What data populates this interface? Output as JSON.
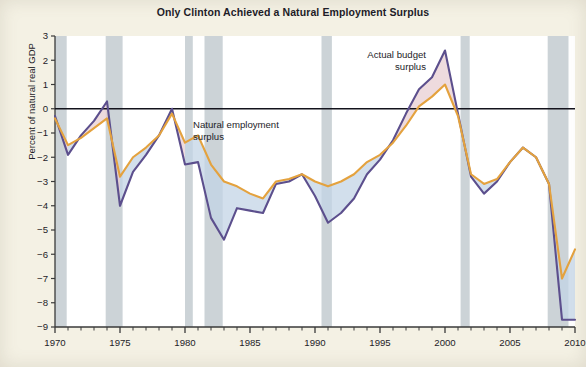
{
  "chart_data": {
    "type": "line",
    "title": "Only Clinton Achieved a Natural Employment Surplus",
    "xlabel": "",
    "ylabel": "Percent of natural real GDP",
    "xlim": [
      1970,
      2010
    ],
    "ylim": [
      -9,
      3
    ],
    "grid": false,
    "legend_position": "inline-annotations",
    "x_ticks": [
      1970,
      1975,
      1980,
      1985,
      1990,
      1995,
      2000,
      2005,
      2010
    ],
    "x_tick_labels": [
      "1970",
      "1975",
      "1980",
      "1985",
      "1990",
      "1995",
      "2000",
      "2005",
      "2010"
    ],
    "x_minor_tick_step": 1,
    "y_ticks": [
      3,
      2,
      1,
      0,
      -1,
      -2,
      -3,
      -4,
      -5,
      -6,
      -7,
      -8,
      -9
    ],
    "y_tick_labels": [
      "3",
      "2",
      "1",
      "0",
      "−1",
      "−2",
      "−3",
      "−4",
      "−5",
      "−6",
      "−7",
      "−8",
      "−9"
    ],
    "x": [
      1970,
      1971,
      1972,
      1973,
      1974,
      1975,
      1976,
      1977,
      1978,
      1979,
      1980,
      1981,
      1982,
      1983,
      1984,
      1985,
      1986,
      1987,
      1988,
      1989,
      1990,
      1991,
      1992,
      1993,
      1994,
      1995,
      1996,
      1997,
      1998,
      1999,
      2000,
      2001,
      2002,
      2003,
      2004,
      2005,
      2006,
      2007,
      2008,
      2009,
      2010
    ],
    "series": [
      {
        "name": "Actual budget surplus",
        "color": "#5c4f8d",
        "values": [
          -0.3,
          -1.9,
          -1.1,
          -0.5,
          0.3,
          -4.0,
          -2.6,
          -1.9,
          -1.1,
          0.0,
          -2.3,
          -2.2,
          -4.5,
          -5.4,
          -4.1,
          -4.2,
          -4.3,
          -3.1,
          -3.0,
          -2.7,
          -3.6,
          -4.7,
          -4.3,
          -3.7,
          -2.7,
          -2.1,
          -1.3,
          -0.2,
          0.8,
          1.3,
          2.4,
          -0.2,
          -2.8,
          -3.5,
          -3.0,
          -2.2,
          -1.6,
          -2.0,
          -3.1,
          -8.7,
          -8.7
        ]
      },
      {
        "name": "Natural employment surplus",
        "color": "#e4a23e",
        "values": [
          -0.4,
          -1.5,
          -1.2,
          -0.8,
          -0.4,
          -2.8,
          -2.0,
          -1.6,
          -1.1,
          -0.2,
          -1.4,
          -1.1,
          -2.3,
          -3.0,
          -3.2,
          -3.5,
          -3.7,
          -3.0,
          -2.9,
          -2.7,
          -3.0,
          -3.2,
          -3.0,
          -2.7,
          -2.2,
          -1.9,
          -1.4,
          -0.7,
          0.1,
          0.5,
          1.0,
          -0.3,
          -2.7,
          -3.1,
          -2.9,
          -2.2,
          -1.6,
          -2.0,
          -3.1,
          -7.0,
          -5.8
        ]
      }
    ],
    "fills": {
      "above_color": "#e8cfd3",
      "below_color": "#c3d4e6",
      "description": "Area between the two lines; pink where actual exceeds natural, blue where actual is below natural."
    },
    "recession_bands": {
      "color": "#c3cbd0",
      "spans": [
        [
          1969.9,
          1970.9
        ],
        [
          1973.9,
          1975.2
        ],
        [
          1980.0,
          1980.6
        ],
        [
          1981.5,
          1982.9
        ],
        [
          1990.5,
          1991.3
        ],
        [
          2001.2,
          2001.9
        ],
        [
          2007.9,
          2009.5
        ]
      ]
    },
    "annotations": [
      {
        "text": "Natural employment\nsurplus",
        "name": "annotation-natural-employment-surplus"
      },
      {
        "text": "Actual budget\nsurplus",
        "name": "annotation-actual-budget-surplus"
      }
    ],
    "zero_line": {
      "value": 0,
      "color": "#13131c"
    }
  }
}
